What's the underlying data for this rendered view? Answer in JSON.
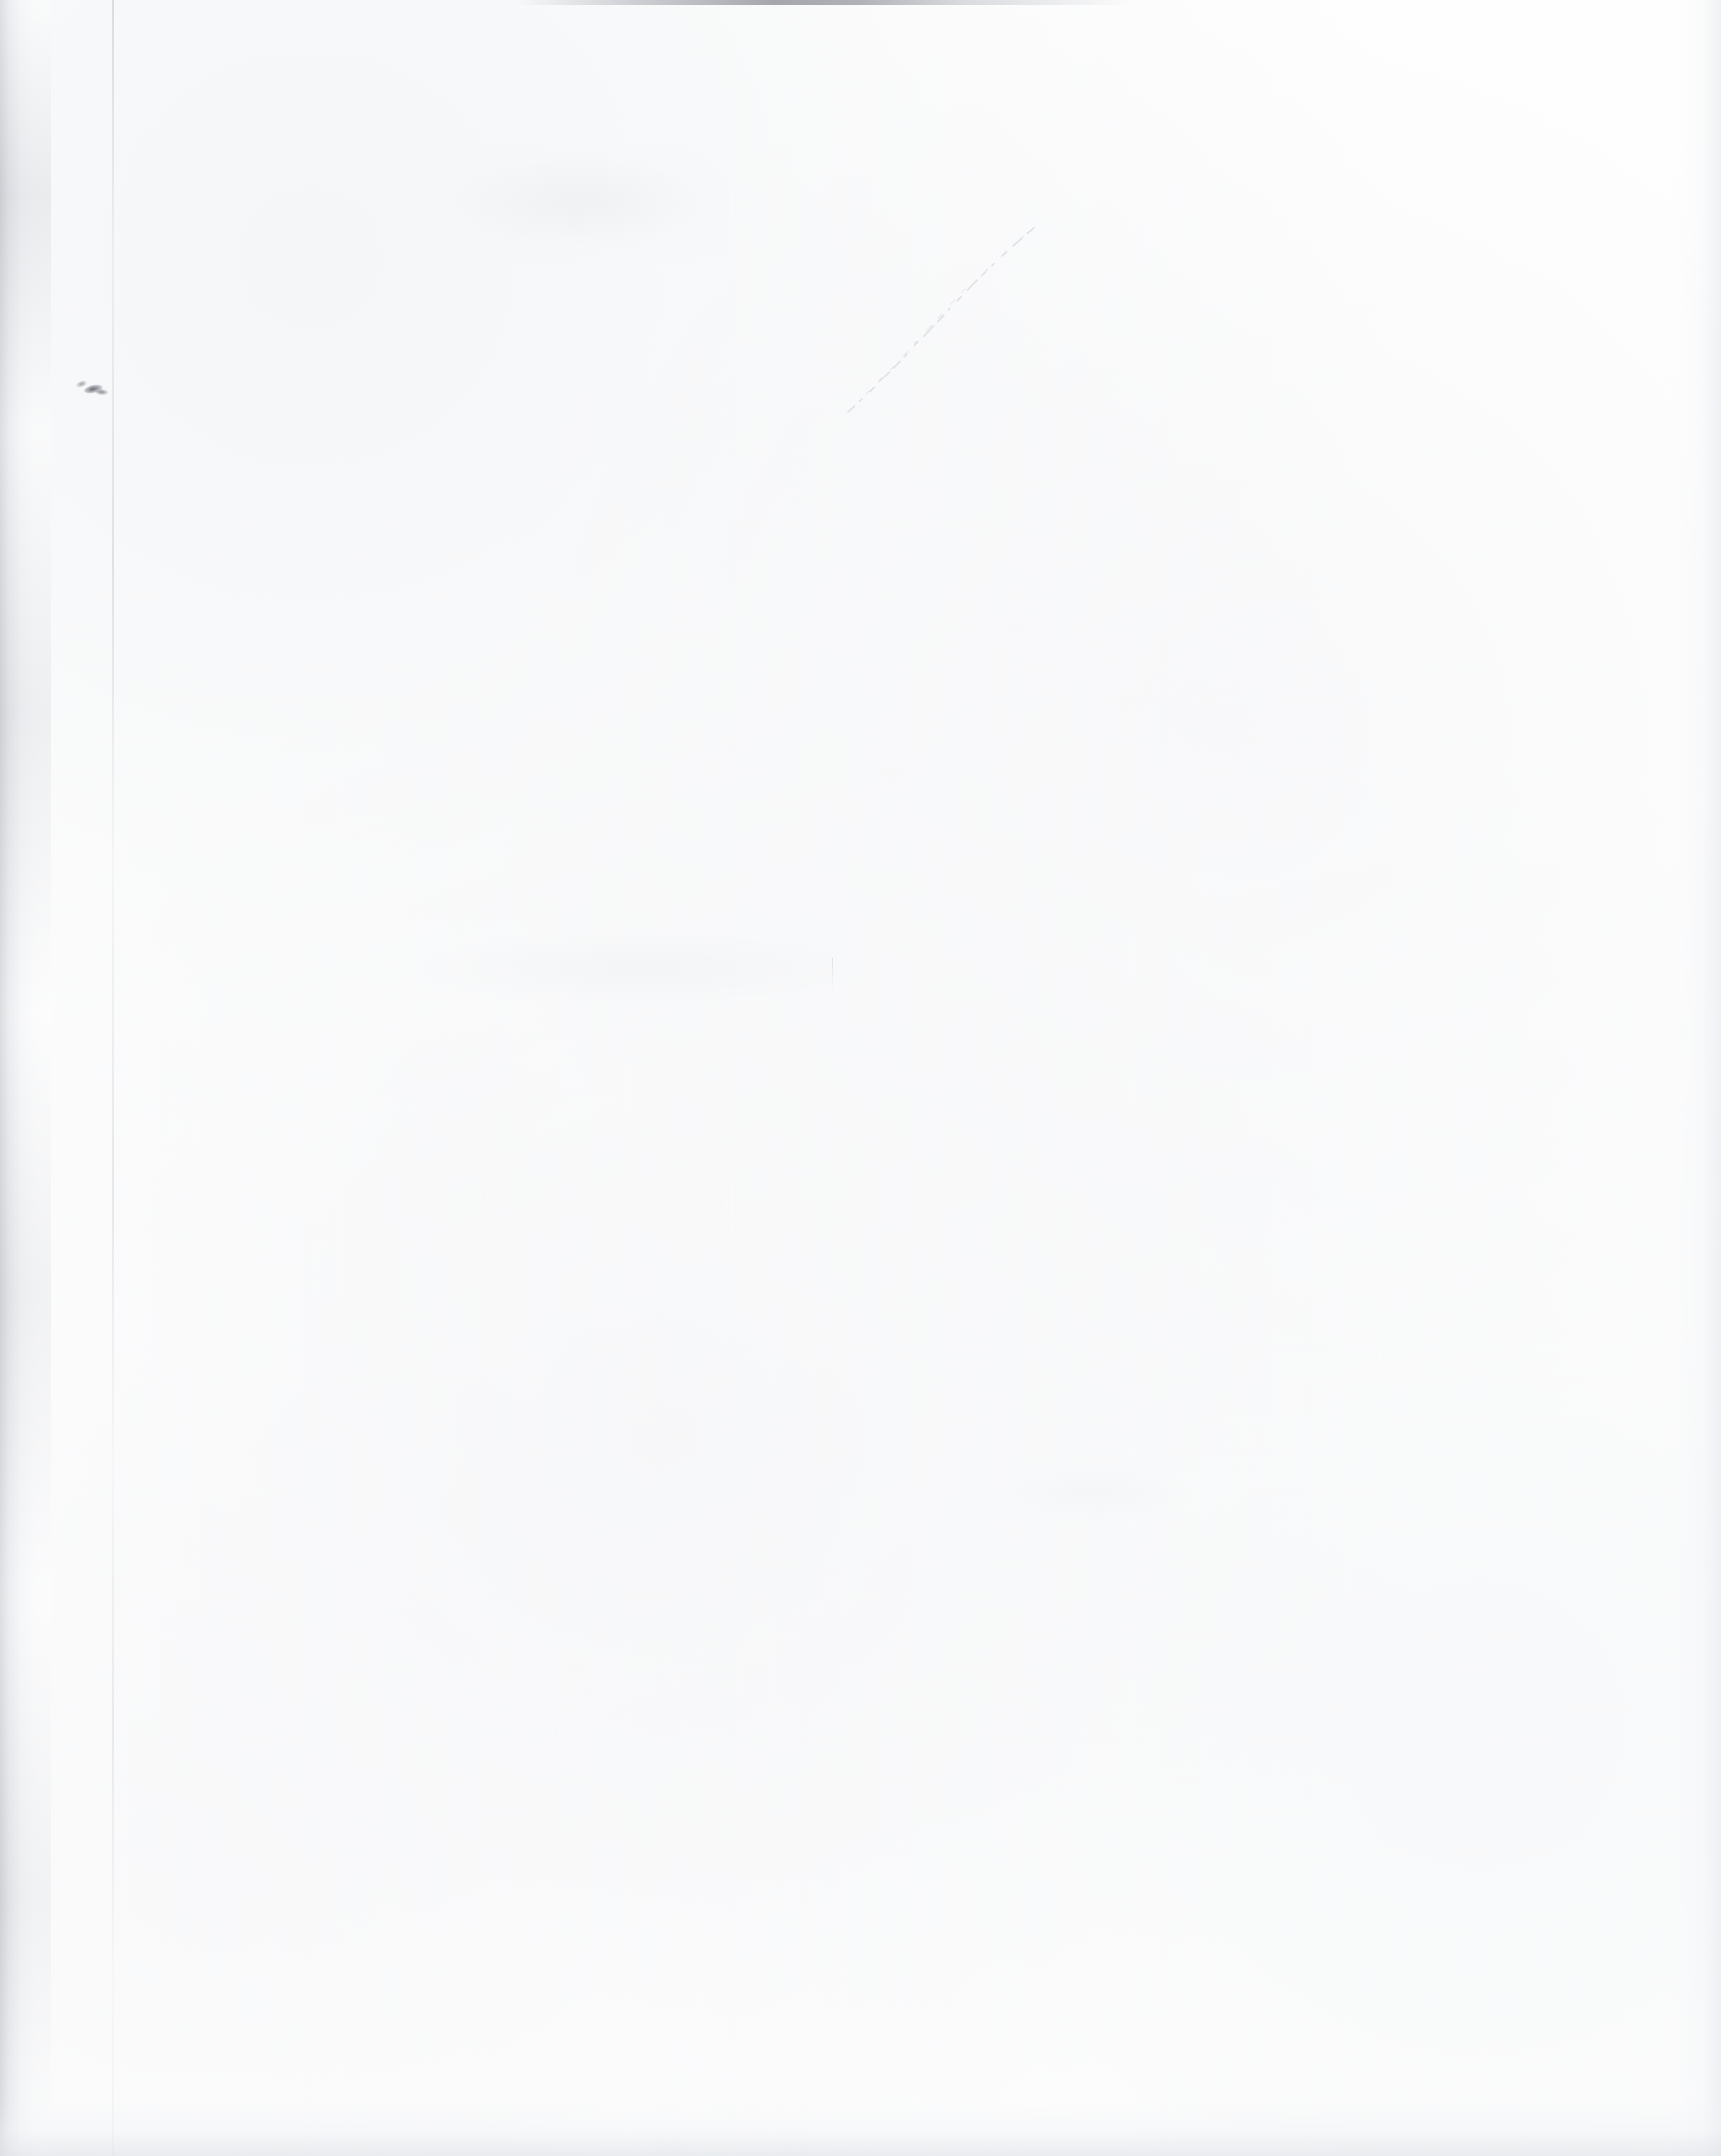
{
  "page": {
    "kind": "blank-scanned-page",
    "width": 1769,
    "height": 2216,
    "text_content": "",
    "description": "Blank scanned document page with no printed or handwritten text."
  },
  "colors": {
    "paper": "#fefefe",
    "page_background": "#ffffff",
    "edge_shadow": "#c4c7cd",
    "top_edge_line": "#8c8f96",
    "page_edge_line": "#cdd0d6",
    "ink_smudge": "#60636a",
    "faint_streak": "#d2d5db"
  },
  "artifacts": [
    {
      "name": "edge-shadow-left",
      "kind": "scan-shadow",
      "edge": "left",
      "x": 0,
      "y": 0,
      "width": 52,
      "height": 2216
    },
    {
      "name": "edge-shadow-right",
      "kind": "scan-shadow",
      "edge": "right",
      "x": 1723,
      "y": 0,
      "width": 46,
      "height": 2216
    },
    {
      "name": "edge-shadow-bottom",
      "kind": "scan-shadow",
      "edge": "bottom",
      "x": 0,
      "y": 2160,
      "width": 1769,
      "height": 56
    },
    {
      "name": "top-edge-line",
      "kind": "scan-edge-line",
      "edge": "top",
      "x": 0,
      "y": 0,
      "width": 1769,
      "height": 5
    },
    {
      "name": "page-edge-line",
      "kind": "vertical-hairline",
      "x": 115,
      "y": 0,
      "width": 2,
      "height": 2216
    },
    {
      "name": "ink-smudge",
      "kind": "ink-speck",
      "x": 78,
      "y": 390,
      "width": 34,
      "height": 18
    },
    {
      "name": "diagonal-streak",
      "kind": "faint-scratch",
      "x": 860,
      "y": 215,
      "width": 270,
      "height": 215
    },
    {
      "name": "shading-patch-upper",
      "kind": "faint-shading",
      "x": 430,
      "y": 150,
      "width": 320,
      "height": 120
    },
    {
      "name": "shading-patch-mid",
      "kind": "faint-shading",
      "x": 380,
      "y": 950,
      "width": 560,
      "height": 90
    },
    {
      "name": "tick-mark-lower",
      "kind": "faint-tick",
      "x": 855,
      "y": 985,
      "width": 1,
      "height": 40
    },
    {
      "name": "shading-patch-lower-right",
      "kind": "faint-shading",
      "x": 1010,
      "y": 1500,
      "width": 230,
      "height": 70
    }
  ]
}
